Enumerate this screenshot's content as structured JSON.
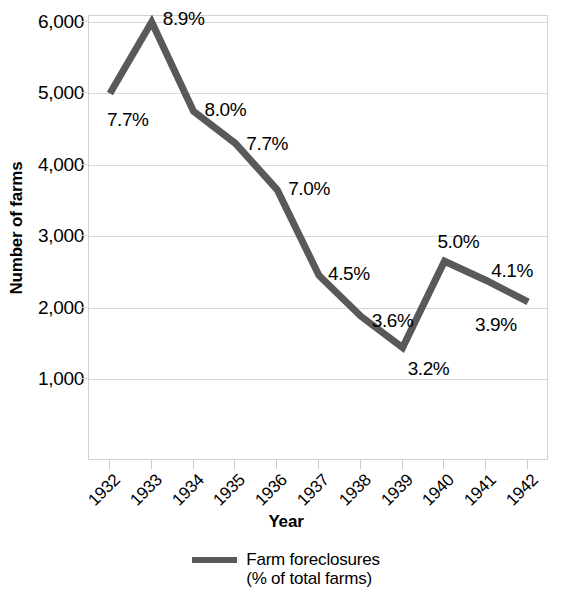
{
  "chart_data": {
    "type": "line",
    "title": "",
    "xlabel": "Year",
    "ylabel": "Number of farms",
    "categories": [
      "1932",
      "1933",
      "1934",
      "1935",
      "1936",
      "1937",
      "1938",
      "1939",
      "1940",
      "1941",
      "1942"
    ],
    "values": [
      5000,
      6000,
      4750,
      4300,
      3650,
      2450,
      1880,
      1440,
      2650,
      2380,
      2080
    ],
    "point_labels": [
      "7.7%",
      "8.9%",
      "8.0%",
      "7.7%",
      "7.0%",
      "4.5%",
      "3.6%",
      "3.2%",
      "5.0%",
      "4.1%",
      "3.9%"
    ],
    "ylim": [
      0,
      6000
    ],
    "y_ticks": [
      6000,
      5000,
      4000,
      3000,
      2000,
      1000
    ],
    "y_tick_labels": [
      "6,000",
      "5,000",
      "4,000",
      "3,000",
      "2,000",
      "1,000"
    ],
    "grid": true,
    "legend_position": "bottom-center",
    "series": [
      {
        "name": "Farm foreclosures (% of total farms)",
        "color": "#595959",
        "values": [
          5000,
          6000,
          4750,
          4300,
          3650,
          2450,
          1880,
          1440,
          2650,
          2380,
          2080
        ]
      }
    ]
  },
  "axes": {
    "y_title": "Number of farms",
    "x_title": "Year",
    "y_tick_labels": [
      "6,000",
      "5,000",
      "4,000",
      "3,000",
      "2,000",
      "1,000"
    ],
    "x_tick_labels": [
      "1932",
      "1933",
      "1934",
      "1935",
      "1936",
      "1937",
      "1938",
      "1939",
      "1940",
      "1941",
      "1942"
    ]
  },
  "data_labels": [
    "7.7%",
    "8.9%",
    "8.0%",
    "7.7%",
    "7.0%",
    "4.5%",
    "3.6%",
    "3.2%",
    "5.0%",
    "4.1%",
    "3.9%"
  ],
  "legend": {
    "line1": "Farm foreclosures",
    "line2": "(% of total farms)",
    "swatch_color": "#595959"
  },
  "colors": {
    "line": "#595959",
    "grid": "#d8d8d8",
    "axis_border": "#d2d2d2",
    "text": "#000000",
    "background": "#ffffff"
  }
}
